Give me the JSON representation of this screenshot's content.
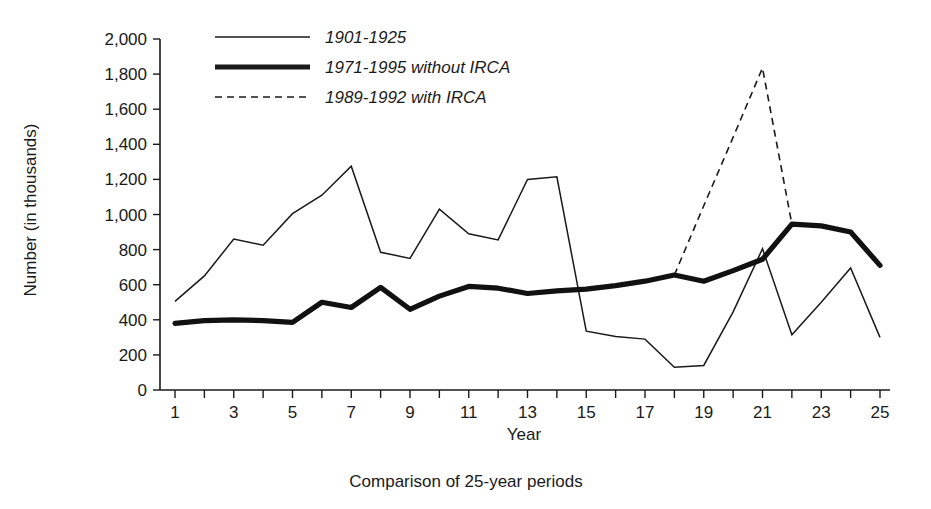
{
  "chart_data": {
    "type": "line",
    "title": "",
    "caption": "Comparison of 25-year periods",
    "xlabel": "Year",
    "ylabel": "Number (in thousands)",
    "xlim": [
      1,
      25
    ],
    "ylim": [
      0,
      2000
    ],
    "grid": false,
    "legend_position": "top-left-inside",
    "x": [
      1,
      2,
      3,
      4,
      5,
      6,
      7,
      8,
      9,
      10,
      11,
      12,
      13,
      14,
      15,
      16,
      17,
      18,
      19,
      20,
      21,
      22,
      23,
      24,
      25
    ],
    "x_tick_labels": [
      "1",
      "3",
      "5",
      "7",
      "9",
      "11",
      "13",
      "15",
      "17",
      "19",
      "21",
      "23",
      "25"
    ],
    "x_tick_values": [
      1,
      3,
      5,
      7,
      9,
      11,
      13,
      15,
      17,
      19,
      21,
      23,
      25
    ],
    "y_tick_labels": [
      "0",
      "200",
      "400",
      "600",
      "800",
      "1,000",
      "1,200",
      "1,400",
      "1,600",
      "1,800",
      "2,000"
    ],
    "y_tick_values": [
      0,
      200,
      400,
      600,
      800,
      1000,
      1200,
      1400,
      1600,
      1800,
      2000
    ],
    "series": [
      {
        "name": "1901-1925",
        "style": "thin-solid",
        "color": "#1a1a1a",
        "x": [
          1,
          2,
          3,
          4,
          5,
          6,
          7,
          8,
          9,
          10,
          11,
          12,
          13,
          14,
          15,
          16,
          17,
          18,
          19,
          20,
          21,
          22,
          23,
          24,
          25
        ],
        "values": [
          505,
          650,
          860,
          825,
          1005,
          1110,
          1275,
          785,
          750,
          1030,
          890,
          855,
          1200,
          1215,
          335,
          305,
          290,
          130,
          140,
          445,
          805,
          315,
          500,
          695,
          300
        ]
      },
      {
        "name": "1971-1995 without IRCA",
        "style": "thick-solid",
        "color": "#111111",
        "x": [
          1,
          2,
          3,
          4,
          5,
          6,
          7,
          8,
          9,
          10,
          11,
          12,
          13,
          14,
          15,
          16,
          17,
          18,
          19,
          20,
          21,
          22,
          23,
          24,
          25
        ],
        "values": [
          380,
          395,
          400,
          395,
          385,
          500,
          470,
          585,
          460,
          535,
          590,
          580,
          550,
          565,
          575,
          595,
          620,
          655,
          620,
          680,
          745,
          945,
          935,
          900,
          710
        ]
      },
      {
        "name": "1989-1992 with IRCA",
        "style": "dashed",
        "color": "#1a1a1a",
        "x": [
          18,
          19,
          20,
          21,
          22
        ],
        "values": [
          655,
          1050,
          1440,
          1835,
          945
        ]
      }
    ]
  },
  "legend": {
    "entries": [
      {
        "label": "1901-1925",
        "style": "thin-solid"
      },
      {
        "label": "1971-1995 without IRCA",
        "style": "thick-solid"
      },
      {
        "label": "1989-1992 with IRCA",
        "style": "dashed"
      }
    ]
  },
  "axes": {
    "y_title": "Number (in thousands)",
    "x_title": "Year"
  },
  "caption": {
    "text": "Comparison of 25-year periods"
  },
  "colors": {
    "ink": "#1a1a1a",
    "background": "#ffffff"
  }
}
